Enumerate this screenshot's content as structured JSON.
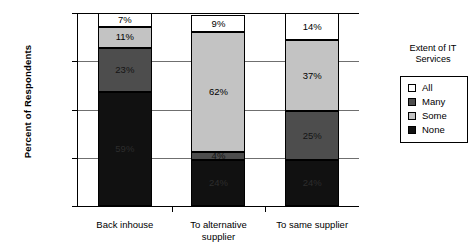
{
  "chart_data": {
    "type": "bar",
    "title": "",
    "subtitle": "",
    "xlabel": "",
    "ylabel": "Percent of Respondents",
    "ylim": [
      0,
      100
    ],
    "ytick_labels": [
      "0%",
      "25%",
      "50%",
      "75%",
      "100%"
    ],
    "ytick_values": [
      0,
      25,
      50,
      75,
      100
    ],
    "grid": true,
    "stacked": true,
    "stack_order_bottom_to_top": [
      "None",
      "Many",
      "Some",
      "All"
    ],
    "legend_position": "right",
    "legend_title": "Extent of IT\nServices",
    "categories": [
      "Back inhouse",
      "To alternative\nsupplier",
      "To same supplier"
    ],
    "series": [
      {
        "name": "None",
        "color": "#111111",
        "values": [
          59,
          24,
          24
        ],
        "labels": [
          "59%",
          "24%",
          "24%"
        ]
      },
      {
        "name": "Many",
        "color": "#4d4d4d",
        "values": [
          23,
          4,
          25
        ],
        "labels": [
          "23%",
          "4%",
          "25%"
        ]
      },
      {
        "name": "Some",
        "color": "#c3c3c3",
        "values": [
          11,
          62,
          37
        ],
        "labels": [
          "11%",
          "62%",
          "37%"
        ]
      },
      {
        "name": "All",
        "color": "#ffffff",
        "values": [
          7,
          9,
          14
        ],
        "labels": [
          "7%",
          "9%",
          "14%"
        ]
      }
    ],
    "legend_entries": [
      {
        "label": "All",
        "color": "#ffffff"
      },
      {
        "label": "Many",
        "color": "#4d4d4d"
      },
      {
        "label": "Some",
        "color": "#c3c3c3"
      },
      {
        "label": "None",
        "color": "#111111"
      }
    ]
  },
  "axis": {
    "y_title": "Percent of Respondents"
  },
  "legend": {
    "title": "Extent of IT\nServices"
  }
}
